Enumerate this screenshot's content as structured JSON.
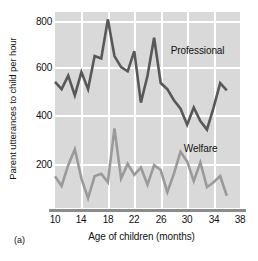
{
  "figure": {
    "panel_id": "(a)",
    "ylabel": "Parent utterances to child per hour",
    "xlabel": "Age of children (months)"
  },
  "axes": {
    "y_ticks": [
      "800",
      "600",
      "400",
      "200"
    ],
    "x_ticks": [
      "10",
      "14",
      "18",
      "22",
      "26",
      "30",
      "34",
      "38"
    ]
  },
  "labels": {
    "professional": "Professional",
    "welfare": "Welfare"
  },
  "colors": {
    "plot_background": "#d9d9d9",
    "gridline": "#ffffff",
    "axis_line": "#8c8c8c",
    "professional_line": "#58585a",
    "welfare_line": "#9a9a9c",
    "text": "#111111"
  },
  "chart_data": {
    "type": "line",
    "title": "",
    "xlabel": "Age of children (months)",
    "ylabel": "Parent utterances to child per hour",
    "xlim": [
      10,
      38
    ],
    "ylim": [
      60,
      860
    ],
    "xticks": [
      10,
      14,
      18,
      22,
      26,
      30,
      34,
      38
    ],
    "yticks": [
      200,
      400,
      600,
      800
    ],
    "grid": true,
    "legend": "inline-annotations",
    "x": [
      10,
      11,
      12,
      13,
      14,
      15,
      16,
      17,
      18,
      19,
      20,
      21,
      22,
      23,
      24,
      25,
      26,
      27,
      28,
      29,
      30,
      31,
      32,
      33,
      34,
      35,
      36
    ],
    "series": [
      {
        "name": "Professional",
        "color": "#58585a",
        "label_position": {
          "x": 27.5,
          "y": 700
        },
        "values": [
          575,
          545,
          600,
          520,
          615,
          545,
          680,
          670,
          830,
          680,
          635,
          618,
          700,
          490,
          600,
          755,
          570,
          545,
          500,
          465,
          400,
          470,
          415,
          380,
          470,
          570,
          540
        ]
      },
      {
        "name": "Welfare",
        "color": "#9a9a9c",
        "label_position": {
          "x": 29.5,
          "y": 300
        },
        "values": [
          190,
          150,
          235,
          300,
          180,
          100,
          190,
          200,
          165,
          385,
          180,
          240,
          195,
          225,
          155,
          235,
          215,
          125,
          200,
          290,
          250,
          170,
          245,
          145,
          165,
          190,
          110
        ]
      }
    ]
  }
}
